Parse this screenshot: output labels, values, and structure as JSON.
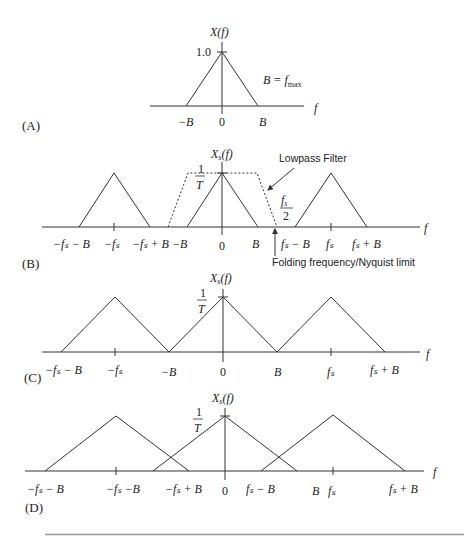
{
  "panels": {
    "A": {
      "label": "(A)",
      "y_label": "X(f)",
      "peak_label": "1.0",
      "annotation": "B = f",
      "annotation_sub": "max",
      "x_axis_label": "f",
      "ticks": [
        "−B",
        "0",
        "B"
      ]
    },
    "B": {
      "label": "(B)",
      "y_label": "X",
      "y_label_sub": "s",
      "y_label_suffix": "(f)",
      "peak_num": "1",
      "peak_den": "T",
      "x_axis_label": "f",
      "filter_label": "Lowpass Filter",
      "nyquist_label": "Folding frequency/Nyquist limit",
      "half_fs_num": "f",
      "half_fs_sub": "s",
      "half_fs_den": "2",
      "ticks": [
        "−fₛ − B",
        "−fₛ",
        "−fₛ + B",
        "−B",
        "0",
        "B",
        "fₛ − B",
        "fₛ",
        "fₛ + B"
      ]
    },
    "C": {
      "label": "(C)",
      "y_label": "X",
      "y_label_sub": "s",
      "y_label_suffix": "(f)",
      "peak_num": "1",
      "peak_den": "T",
      "x_axis_label": "f",
      "ticks": [
        "−fₛ − B",
        "−fₛ",
        "−B",
        "0",
        "B",
        "fₛ",
        "fₛ + B"
      ]
    },
    "D": {
      "label": "(D)",
      "y_label": "X",
      "y_label_sub": "s",
      "y_label_suffix": "(f)",
      "peak_num": "1",
      "peak_den": "T",
      "x_axis_label": "f",
      "ticks": [
        "−fₛ − B",
        "−fₛ −B",
        "−fₛ + B",
        "0",
        "fₛ − B",
        "B",
        "fₛ",
        "fₛ + B"
      ]
    }
  },
  "colors": {
    "line": "#333333",
    "rule": "#999999"
  }
}
